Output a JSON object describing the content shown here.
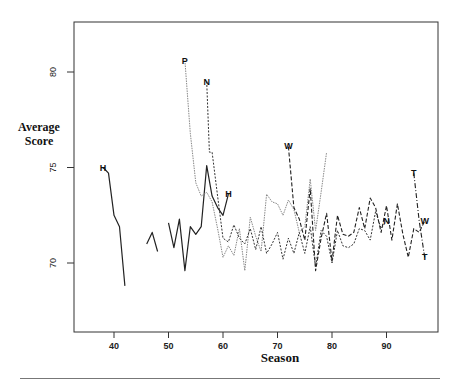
{
  "chart_data": {
    "type": "line",
    "title": "",
    "xlabel": "Season",
    "ylabel": "Average Score",
    "xlim": [
      32,
      98
    ],
    "ylim": [
      66.5,
      82.5
    ],
    "xticks": [
      40,
      50,
      60,
      70,
      80,
      90
    ],
    "yticks": [
      70,
      75,
      80
    ],
    "grid": false,
    "legend": "none (series identified by inline letter labels)",
    "series": [
      {
        "name": "H",
        "style": "solid",
        "segments": [
          {
            "x": [
              38,
              39,
              40,
              41,
              42
            ],
            "y": [
              75.0,
              74.7,
              72.5,
              71.9,
              68.8
            ]
          },
          {
            "x": [
              46,
              47,
              48
            ],
            "y": [
              71.0,
              71.6,
              70.6
            ]
          },
          {
            "x": [
              50,
              51,
              52,
              53,
              54,
              55,
              56,
              57,
              58,
              59,
              60,
              61
            ],
            "y": [
              72.1,
              70.8,
              72.3,
              69.6,
              71.9,
              71.5,
              71.9,
              75.1,
              73.5,
              72.9,
              72.5,
              73.6
            ]
          }
        ],
        "label_at": [
          38,
          75.0
        ],
        "label2_at": [
          61,
          73.6
        ]
      },
      {
        "name": "P",
        "style": "dotted-light",
        "segments": [
          {
            "x": [
              53,
              54,
              55,
              56,
              57,
              58,
              59,
              60,
              61,
              62,
              63,
              64,
              65,
              66,
              67,
              68,
              69,
              70,
              71,
              72,
              73,
              74,
              75,
              76,
              77,
              78,
              79
            ],
            "y": [
              80.6,
              76.8,
              74.2,
              73.5,
              73.7,
              73.2,
              71.8,
              70.3,
              70.9,
              70.4,
              71.8,
              69.6,
              72.4,
              71.4,
              70.6,
              73.6,
              73.2,
              73.1,
              72.5,
              73.3,
              72.8,
              71.6,
              71.9,
              74.4,
              71.7,
              73.7,
              75.8
            ]
          }
        ],
        "label_at": [
          53,
          80.6
        ]
      },
      {
        "name": "N",
        "style": "dotted",
        "segments": [
          {
            "x": [
              57,
              57.5,
              58,
              59,
              60,
              61,
              62,
              63,
              64,
              65,
              66,
              67,
              68,
              69,
              70,
              71,
              72,
              73,
              74,
              75,
              76,
              77,
              78,
              79,
              80,
              81,
              82,
              83,
              84,
              85,
              86,
              87,
              88,
              89,
              90
            ],
            "y": [
              79.5,
              75.8,
              75.8,
              73.5,
              71.3,
              71.1,
              72.0,
              71.3,
              71.0,
              71.8,
              70.7,
              71.9,
              70.5,
              71.0,
              71.6,
              70.2,
              71.3,
              70.5,
              71.6,
              70.5,
              71.9,
              69.8,
              71.7,
              71.4,
              70.0,
              71.7,
              70.9,
              70.8,
              71.0,
              71.8,
              71.7,
              71.2,
              72.7,
              71.8,
              72.2
            ]
          }
        ],
        "label_at": [
          57,
          79.5
        ],
        "label2_at": [
          90,
          72.2
        ]
      },
      {
        "name": "W",
        "style": "dashed",
        "segments": [
          {
            "x": [
              72,
              73,
              74,
              75,
              76,
              77,
              78,
              79,
              80,
              81,
              82,
              83,
              84,
              85,
              86,
              87,
              88,
              89,
              90,
              91,
              92,
              93,
              94,
              95,
              96,
              97
            ],
            "y": [
              76.1,
              72.9,
              72.3,
              71.2,
              73.9,
              69.6,
              71.3,
              72.6,
              70.1,
              72.5,
              71.5,
              71.4,
              71.6,
              72.9,
              71.8,
              73.4,
              72.9,
              71.6,
              73.0,
              71.2,
              73.1,
              71.5,
              70.3,
              71.8,
              71.6,
              72.2
            ]
          }
        ],
        "label_at": [
          72,
          76.1
        ],
        "label2_at": [
          97,
          72.2
        ]
      },
      {
        "name": "T",
        "style": "dash-dot",
        "segments": [
          {
            "x": [
              95,
              96,
              97
            ],
            "y": [
              74.7,
              72.2,
              70.3
            ]
          }
        ],
        "label_at": [
          95,
          74.7
        ],
        "label2_at": [
          97,
          70.3
        ]
      }
    ]
  },
  "axes": {
    "xlabel": "Season",
    "ylabel_line1": "Average",
    "ylabel_line2": "Score"
  }
}
